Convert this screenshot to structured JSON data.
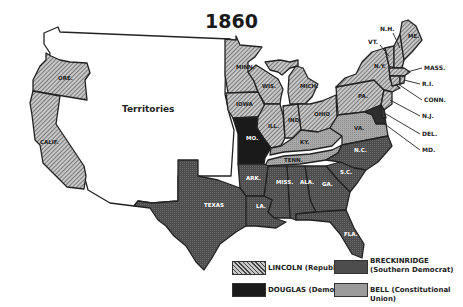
{
  "title": "1860",
  "colors": {
    "lincoln": "#a9a9a9",
    "douglas": "#1c1c1c",
    "breckinridge": "#5a5a5a",
    "bell": "#9b9b9b",
    "territory": "#ffffff",
    "outline": "#222222"
  },
  "territory_label": "Territories",
  "states": {
    "lincoln": [
      "ORE.",
      "CALIF.",
      "MINN.",
      "WIS.",
      "IOWA",
      "ILL.",
      "IND.",
      "OHIO",
      "MICH.",
      "PA.",
      "N.Y.",
      "VT.",
      "N.H.",
      "ME.",
      "MASS.",
      "R.I.",
      "CONN.",
      "N.J."
    ],
    "douglas": [
      "MO."
    ],
    "breckinridge": [
      "TEXAS",
      "ARK.",
      "LA.",
      "MISS.",
      "ALA.",
      "GA.",
      "FLA.",
      "S.C.",
      "N.C.",
      "DEL.",
      "MD."
    ],
    "bell": [
      "VA.",
      "KY.",
      "TENN."
    ]
  },
  "callouts": [
    "N.H.",
    "VT.",
    "MASS.",
    "R.I.",
    "CONN.",
    "N.J.",
    "DEL.",
    "MD."
  ],
  "legend": [
    {
      "key": "lincoln",
      "label": "LINCOLN (Republican)"
    },
    {
      "key": "breckinridge",
      "label": "BRECKINRIDGE",
      "sublabel": "(Southern Democrat)"
    },
    {
      "key": "douglas",
      "label": "DOUGLAS (Democrat)"
    },
    {
      "key": "bell",
      "label": "BELL (Constitutional Union)"
    }
  ]
}
